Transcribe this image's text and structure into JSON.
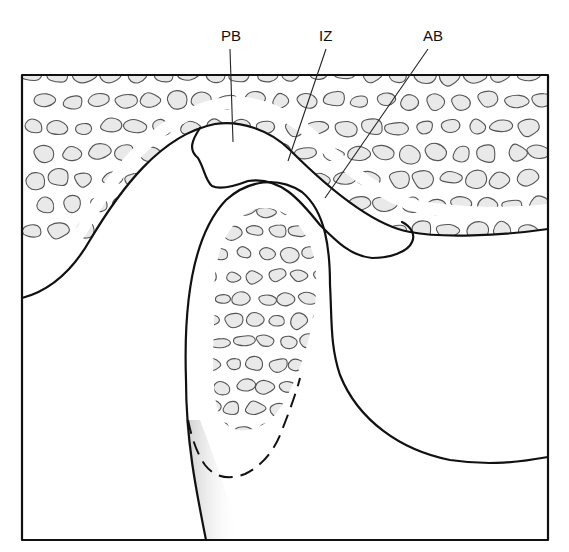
{
  "figure": {
    "labels": [
      {
        "id": "pb",
        "text": "PB",
        "meaning": "posterior band"
      },
      {
        "id": "iz",
        "text": "IZ",
        "meaning": "intermediate zone"
      },
      {
        "id": "ab",
        "text": "AB",
        "meaning": "anterior band"
      }
    ]
  },
  "colors": {
    "line": "#111111",
    "bone_fill": "#e9e9e9",
    "trabecula_stroke": "#555555",
    "background": "#ffffff"
  }
}
